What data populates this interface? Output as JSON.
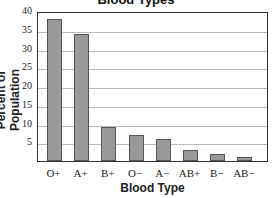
{
  "chart_data": {
    "type": "bar",
    "title": "Blood Types",
    "xlabel": "Blood Type",
    "ylabel": "Percent of Population",
    "categories": [
      "O+",
      "A+",
      "B+",
      "O−",
      "A−",
      "AB+",
      "B−",
      "AB−"
    ],
    "values": [
      38,
      34,
      9,
      7,
      6,
      3,
      2,
      1
    ],
    "ylim": [
      0,
      40
    ],
    "yticks": [
      "5",
      "10",
      "15",
      "20",
      "25",
      "30",
      "35",
      "40"
    ],
    "grid": true,
    "bar_color": "#999999"
  }
}
